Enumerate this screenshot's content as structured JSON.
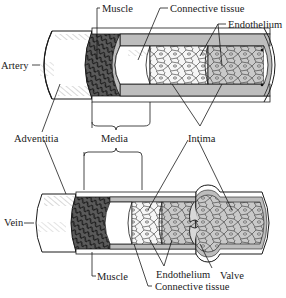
{
  "diagram": {
    "artery": {
      "title": "Artery",
      "labels": {
        "muscle": "Muscle",
        "connective_tissue": "Connective tissue",
        "endothelium": "Endothelium"
      }
    },
    "shared_labels": {
      "adventitia": "Adventitia",
      "media": "Media",
      "intima": "Intima"
    },
    "vein": {
      "title": "Vein",
      "labels": {
        "muscle": "Muscle",
        "endothelium": "Endothelium",
        "valve": "Valve",
        "connective_tissue": "Connective tissue"
      }
    },
    "colors": {
      "outline": "#1a1a1a",
      "wall_gray": "#bdbdbd",
      "muscle_dark": "#3a3a3a",
      "cell_fill": "#f4f4f4",
      "background": "#ffffff"
    }
  }
}
